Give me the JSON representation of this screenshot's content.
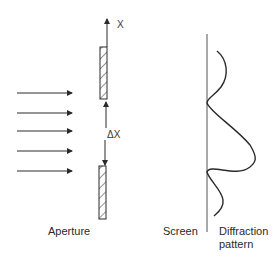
{
  "figure": {
    "type": "single-slit diffraction schematic",
    "labels": {
      "axis": "X",
      "slit_width": "ΔX",
      "aperture": "Aperture",
      "screen": "Screen",
      "pattern_line1": "Diffraction",
      "pattern_line2": "pattern"
    },
    "incident_rays": 5,
    "colors": {
      "line": "#2a2a2a",
      "background": "#ffffff"
    }
  }
}
